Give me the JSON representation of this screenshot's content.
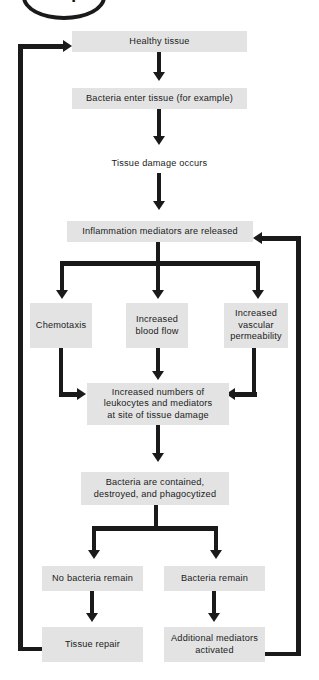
{
  "badge": {
    "label": "loop",
    "name": "loop-badge"
  },
  "diagram": {
    "box_color": "#e3e3e3",
    "line_color": "#1a1a1a",
    "text_color": "#1b1b1b",
    "background": "#ffffff"
  },
  "nodes": [
    {
      "id": "healthy-tissue",
      "label": "Healthy tissue"
    },
    {
      "id": "bacteria-enter",
      "label": "Bacteria enter tissue (for example)"
    },
    {
      "id": "tissue-damage",
      "label": "Tissue damage occurs"
    },
    {
      "id": "mediators-released",
      "label": "Inflammation mediators are released"
    },
    {
      "id": "chemotaxis",
      "label": "Chemotaxis"
    },
    {
      "id": "increased-blood-flow",
      "label": "Increased\nblood flow"
    },
    {
      "id": "increased-permeability",
      "label": "Increased\nvascular\npermeability"
    },
    {
      "id": "increased-leukocytes",
      "label": "Increased numbers of\nleukocytes and mediators\nat site of tissue damage"
    },
    {
      "id": "bacteria-contained",
      "label": "Bacteria are contained,\ndestroyed, and phagocytized"
    },
    {
      "id": "no-bacteria-remain",
      "label": "No bacteria remain"
    },
    {
      "id": "bacteria-remain",
      "label": "Bacteria remain"
    },
    {
      "id": "tissue-repair",
      "label": "Tissue repair"
    },
    {
      "id": "additional-mediators",
      "label": "Additional mediators\nactivated"
    }
  ],
  "edges": [
    {
      "from": "healthy-tissue",
      "to": "bacteria-enter",
      "type": "straight-down"
    },
    {
      "from": "bacteria-enter",
      "to": "tissue-damage",
      "type": "straight-down"
    },
    {
      "from": "tissue-damage",
      "to": "mediators-released",
      "type": "straight-down"
    },
    {
      "from": "mediators-released",
      "to": "chemotaxis",
      "type": "branch-left"
    },
    {
      "from": "mediators-released",
      "to": "increased-blood-flow",
      "type": "branch-center"
    },
    {
      "from": "mediators-released",
      "to": "increased-permeability",
      "type": "branch-right"
    },
    {
      "from": "chemotaxis",
      "to": "increased-leukocytes",
      "type": "merge-from-left"
    },
    {
      "from": "increased-blood-flow",
      "to": "increased-leukocytes",
      "type": "straight-down"
    },
    {
      "from": "increased-permeability",
      "to": "increased-leukocytes",
      "type": "merge-from-right"
    },
    {
      "from": "increased-leukocytes",
      "to": "bacteria-contained",
      "type": "straight-down"
    },
    {
      "from": "bacteria-contained",
      "to": "no-bacteria-remain",
      "type": "branch-left"
    },
    {
      "from": "bacteria-contained",
      "to": "bacteria-remain",
      "type": "branch-right"
    },
    {
      "from": "no-bacteria-remain",
      "to": "tissue-repair",
      "type": "straight-down"
    },
    {
      "from": "bacteria-remain",
      "to": "additional-mediators",
      "type": "straight-down"
    },
    {
      "from": "tissue-repair",
      "to": "healthy-tissue",
      "type": "feedback-loop-left"
    },
    {
      "from": "additional-mediators",
      "to": "mediators-released",
      "type": "feedback-loop-right"
    }
  ]
}
